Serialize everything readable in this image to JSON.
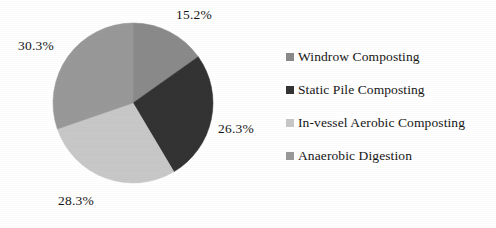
{
  "chart_data": {
    "type": "pie",
    "title": "",
    "subtitle": "",
    "xlabel": "",
    "ylabel": "",
    "grid": false,
    "legend_position": "right",
    "start_angle_deg": 0,
    "direction": "clockwise",
    "categories": [
      "Windrow Composting",
      "Static Pile Composting",
      "In-vessel Aerobic Composting",
      "Anaerobic Digestion"
    ],
    "values": [
      15.2,
      26.3,
      28.3,
      30.3
    ],
    "value_unit": "%",
    "data_labels": [
      "15.2%",
      "26.3%",
      "28.3%",
      "30.3%"
    ],
    "colors": [
      "#8a8a8a",
      "#333333",
      "#c8c8c8",
      "#999999"
    ],
    "slices": [
      {
        "label": "Windrow Composting",
        "value": 15.2,
        "data_label": "15.2%",
        "color": "#8a8a8a",
        "start_deg": 0,
        "end_deg": 54.72
      },
      {
        "label": "Static Pile Composting",
        "value": 26.3,
        "data_label": "26.3%",
        "color": "#333333",
        "start_deg": 54.72,
        "end_deg": 149.4
      },
      {
        "label": "In-vessel Aerobic Composting",
        "value": 28.3,
        "data_label": "28.3%",
        "color": "#c8c8c8",
        "start_deg": 149.4,
        "end_deg": 251.28
      },
      {
        "label": "Anaerobic Digestion",
        "value": 30.3,
        "data_label": "30.3%",
        "color": "#999999",
        "start_deg": 251.28,
        "end_deg": 360
      }
    ]
  },
  "pie": {
    "center_x": 133,
    "center_y": 103,
    "radius": 80,
    "labels": {
      "windrow": "15.2%",
      "static_pile": "26.3%",
      "in_vessel": "28.3%",
      "anaerobic": "30.3%"
    }
  },
  "legend": {
    "items": [
      {
        "label": "Windrow Composting",
        "color": "#8a8a8a"
      },
      {
        "label": "Static Pile Composting",
        "color": "#333333"
      },
      {
        "label": "In-vessel Aerobic Composting",
        "color": "#c8c8c8"
      },
      {
        "label": "Anaerobic Digestion",
        "color": "#999999"
      }
    ]
  },
  "background_color": "#ffffff",
  "text_color": "#161616"
}
